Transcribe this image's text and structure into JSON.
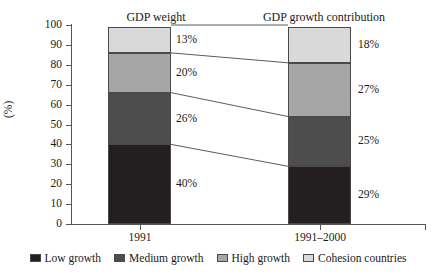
{
  "chart_data": {
    "type": "bar",
    "subtype": "stacked-100-percent",
    "title": "",
    "xlabel": "",
    "ylabel": "(%)",
    "ylim": [
      0,
      100
    ],
    "yticks": [
      0,
      10,
      20,
      30,
      40,
      50,
      60,
      70,
      80,
      90,
      100
    ],
    "grid": false,
    "legend_position": "bottom",
    "categories": [
      "1991",
      "1991–2000"
    ],
    "column_titles": [
      "GDP weight",
      "GDP growth contribution"
    ],
    "series": [
      {
        "name": "Low growth",
        "color": "#231f20",
        "values": [
          40,
          29
        ],
        "labels": [
          "40%",
          "29%"
        ]
      },
      {
        "name": "Medium growth",
        "color": "#4d4d4d",
        "values": [
          26,
          25
        ],
        "labels": [
          "26%",
          "25%"
        ]
      },
      {
        "name": "High growth",
        "color": "#a6a6a6",
        "values": [
          20,
          27
        ],
        "labels": [
          "20%",
          "27%"
        ]
      },
      {
        "name": "Cohesion countries",
        "color": "#d9d9d9",
        "values": [
          13,
          18
        ],
        "labels": [
          "13%",
          "18%"
        ]
      }
    ]
  },
  "axis": {
    "y_title": "(%)",
    "y_tick_labels": [
      "100",
      "90",
      "80",
      "70",
      "60",
      "50",
      "40",
      "30",
      "20",
      "10",
      "0"
    ]
  },
  "titles": {
    "left": "GDP weight",
    "right": "GDP growth contribution"
  },
  "categories": {
    "left": "1991",
    "right": "1991–2000"
  },
  "value_labels": {
    "left": [
      "13%",
      "20%",
      "26%",
      "40%"
    ],
    "right": [
      "18%",
      "27%",
      "25%",
      "29%"
    ]
  },
  "legend": {
    "items": [
      {
        "label": "Low growth",
        "color": "#231f20"
      },
      {
        "label": "Medium growth",
        "color": "#4d4d4d"
      },
      {
        "label": "High growth",
        "color": "#a6a6a6"
      },
      {
        "label": "Cohesion countries",
        "color": "#d9d9d9"
      }
    ]
  }
}
